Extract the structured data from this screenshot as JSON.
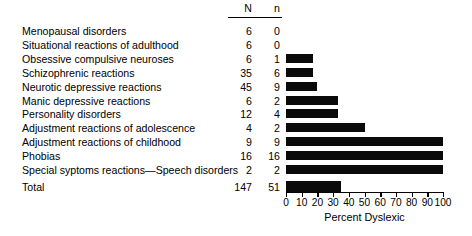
{
  "chart_data": {
    "type": "bar",
    "orientation": "horizontal",
    "title": "",
    "xlabel": "Percent Dyslexic",
    "ylabel": "",
    "xlim": [
      0,
      100
    ],
    "xticks": [
      0,
      10,
      20,
      30,
      40,
      50,
      60,
      70,
      80,
      90,
      100
    ],
    "grid": false,
    "legend": null,
    "bar_color": "#0a0a0a",
    "columns": [
      "N",
      "n"
    ],
    "categories": [
      "Menopausal disorders",
      "Situational reactions of adulthood",
      "Obsessive compulsive neuroses",
      "Schizophrenic reactions",
      "Neurotic depressive reactions",
      "Manic depressive reactions",
      "Personality disorders",
      "Adjustment reactions of adolescence",
      "Adjustment reactions of childhood",
      "Phobias",
      "Special syptoms reactions—Speech disorders",
      "Total"
    ],
    "series": [
      {
        "name": "N",
        "values": [
          6,
          6,
          6,
          35,
          45,
          6,
          12,
          4,
          9,
          16,
          2,
          147
        ]
      },
      {
        "name": "n",
        "values": [
          0,
          0,
          1,
          6,
          9,
          2,
          4,
          2,
          9,
          16,
          2,
          51
        ]
      },
      {
        "name": "Percent Dyslexic",
        "values": [
          0,
          0,
          17,
          17,
          20,
          33,
          33,
          50,
          100,
          100,
          100,
          35
        ]
      }
    ],
    "rows": [
      {
        "label": "Menopausal disorders",
        "N": "6",
        "n": "0",
        "percent": 0
      },
      {
        "label": "Situational reactions of adulthood",
        "N": "6",
        "n": "0",
        "percent": 0
      },
      {
        "label": "Obsessive compulsive neuroses",
        "N": "6",
        "n": "1",
        "percent": 17
      },
      {
        "label": "Schizophrenic reactions",
        "N": "35",
        "n": "6",
        "percent": 17
      },
      {
        "label": "Neurotic depressive reactions",
        "N": "45",
        "n": "9",
        "percent": 20
      },
      {
        "label": "Manic depressive reactions",
        "N": "6",
        "n": "2",
        "percent": 33
      },
      {
        "label": "Personality disorders",
        "N": "12",
        "n": "4",
        "percent": 33
      },
      {
        "label": "Adjustment reactions of adolescence",
        "N": "4",
        "n": "2",
        "percent": 50
      },
      {
        "label": "Adjustment reactions of childhood",
        "N": "9",
        "n": "9",
        "percent": 100
      },
      {
        "label": "Phobias",
        "N": "16",
        "n": "16",
        "percent": 100
      },
      {
        "label": "Special syptoms reactions—Speech disorders",
        "N": "2",
        "n": "2",
        "percent": 100
      },
      {
        "label": "Total",
        "N": "147",
        "n": "51",
        "percent": 35
      }
    ]
  },
  "header": {
    "N_label": "N",
    "n_label": "n"
  },
  "axis": {
    "title": "Percent Dyslexic",
    "tick_labels": [
      "0",
      "10",
      "20",
      "30",
      "40",
      "50",
      "60",
      "70",
      "80",
      "90",
      "100"
    ]
  }
}
